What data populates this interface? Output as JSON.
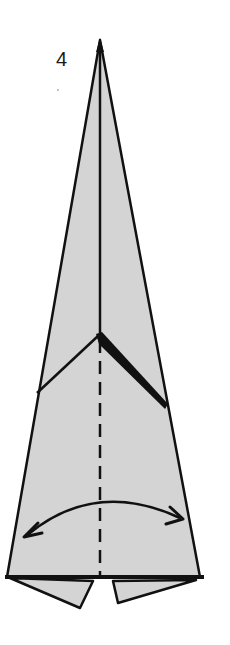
{
  "diagram": {
    "step_number": "4",
    "colors": {
      "paper": "#d4d4d4",
      "line": "#111111",
      "background": "#ffffff"
    },
    "elements": [
      "paper-kite-shape",
      "center-crease-line",
      "valley-fold-dashed-line",
      "chevron-fold-lines",
      "bottom-flaps",
      "unfold-double-arrow"
    ]
  }
}
